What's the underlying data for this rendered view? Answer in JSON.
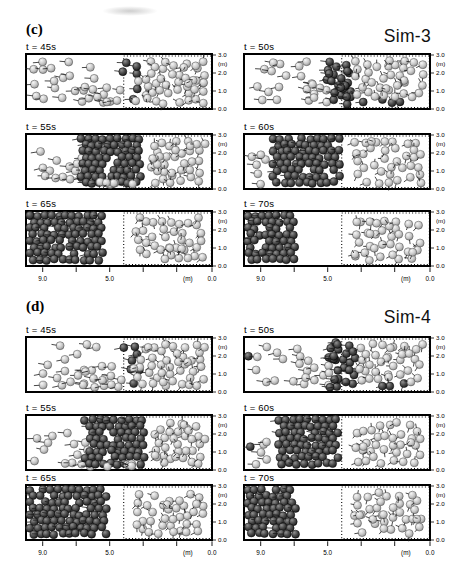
{
  "figure": {
    "background": "#ffffff",
    "colors": {
      "border": "#000000",
      "velocity_vector": "#1a1a1a",
      "dark_particle_highlight": "#909090",
      "dark_particle_core": "#4a4a4a",
      "dark_particle_edge": "#161616",
      "light_particle_highlight": "#f6f6f6",
      "light_particle_core": "#cccccc",
      "light_particle_edge": "#8c8c8c"
    },
    "y_axis": {
      "unit": "(m)",
      "tick_labels": [
        "3.0",
        "2.0",
        "1.0",
        "0.0"
      ]
    },
    "x_axis": {
      "unit": "(m)",
      "unit_frac": 0.87,
      "major": [
        {
          "label": "9.0",
          "frac": 0.09
        },
        {
          "label": "5.0",
          "frac": 0.45
        },
        {
          "label": "0.0",
          "frac": 1.0
        }
      ],
      "minor_fracs": [
        0.27,
        0.63,
        0.81
      ]
    },
    "dashed_sample_region": {
      "x_start_frac": 0.525,
      "style": "dotted"
    },
    "panels": [
      {
        "panel_label": "(c)",
        "sim_label": "Sim-3",
        "subplots": [
          {
            "time_label": "t = 45s",
            "groups": [
              {
                "kind": "scatter",
                "color": "light",
                "n": 20,
                "x0": 0.01,
                "x1": 0.52,
                "y0": 0.05,
                "y1": 0.95,
                "vec": "left"
              },
              {
                "kind": "scatter",
                "color": "light",
                "n": 9,
                "x0": 0.28,
                "x1": 0.54,
                "y0": 0.5,
                "y1": 0.98,
                "vec": "left"
              },
              {
                "kind": "scatter",
                "color": "dark",
                "n": 6,
                "x0": 0.49,
                "x1": 0.63,
                "y0": 0.08,
                "y1": 0.92,
                "vec": "left"
              },
              {
                "kind": "scatter",
                "color": "light",
                "n": 44,
                "x0": 0.55,
                "x1": 0.985,
                "y0": 0.03,
                "y1": 0.97,
                "vec": "rand"
              }
            ]
          },
          {
            "time_label": "t = 50s",
            "groups": [
              {
                "kind": "scatter",
                "color": "light",
                "n": 15,
                "x0": 0.01,
                "x1": 0.4,
                "y0": 0.05,
                "y1": 0.95,
                "vec": "left"
              },
              {
                "kind": "scatter",
                "color": "light",
                "n": 7,
                "x0": 0.3,
                "x1": 0.48,
                "y0": 0.4,
                "y1": 0.98,
                "vec": "left"
              },
              {
                "kind": "scatter",
                "color": "dark",
                "n": 24,
                "x0": 0.42,
                "x1": 0.6,
                "y0": 0.02,
                "y1": 0.98,
                "vec": "left"
              },
              {
                "kind": "scatter",
                "color": "dark",
                "n": 4,
                "x0": 0.6,
                "x1": 0.88,
                "y0": 0.74,
                "y1": 0.98,
                "vec": "rand"
              },
              {
                "kind": "scatter",
                "color": "light",
                "n": 36,
                "x0": 0.56,
                "x1": 0.985,
                "y0": 0.03,
                "y1": 0.88,
                "vec": "rand"
              }
            ]
          },
          {
            "time_label": "t = 55s",
            "groups": [
              {
                "kind": "scatter",
                "color": "light",
                "n": 8,
                "x0": 0.01,
                "x1": 0.26,
                "y0": 0.15,
                "y1": 0.95,
                "vec": "left"
              },
              {
                "kind": "scatter",
                "color": "light",
                "n": 8,
                "x0": 0.2,
                "x1": 0.36,
                "y0": 0.35,
                "y1": 0.98,
                "vec": "left"
              },
              {
                "kind": "packed",
                "color": "dark",
                "x0": 0.28,
                "x1": 0.63,
                "y0": 0.0,
                "y1": 1.0,
                "vec": "left-sparse"
              },
              {
                "kind": "scatter",
                "color": "light",
                "n": 6,
                "x0": 0.37,
                "x1": 0.6,
                "y0": 0.8,
                "y1": 1.0,
                "vec": "rand"
              },
              {
                "kind": "scatter",
                "color": "light",
                "n": 36,
                "x0": 0.64,
                "x1": 0.985,
                "y0": 0.04,
                "y1": 0.97,
                "vec": "rand"
              }
            ]
          },
          {
            "time_label": "t = 60s",
            "groups": [
              {
                "kind": "scatter",
                "color": "light",
                "n": 6,
                "x0": 0.02,
                "x1": 0.17,
                "y0": 0.3,
                "y1": 0.98,
                "vec": "left"
              },
              {
                "kind": "packed",
                "color": "dark",
                "x0": 0.14,
                "x1": 0.53,
                "y0": 0.0,
                "y1": 1.0,
                "vec": "left-sparse"
              },
              {
                "kind": "scatter",
                "color": "light",
                "n": 36,
                "x0": 0.57,
                "x1": 0.975,
                "y0": 0.05,
                "y1": 0.97,
                "vec": "rand"
              }
            ]
          },
          {
            "time_label": "t = 65s",
            "groups": [
              {
                "kind": "scatter",
                "color": "dark",
                "n": 1,
                "x0": 0.0,
                "x1": 0.025,
                "y0": 0.0,
                "y1": 0.06,
                "vec": null
              },
              {
                "kind": "packed",
                "color": "dark",
                "x0": 0.0,
                "x1": 0.44,
                "y0": 0.0,
                "y1": 1.0,
                "vec": "left-sparse"
              },
              {
                "kind": "scatter",
                "color": "light",
                "n": 38,
                "x0": 0.56,
                "x1": 0.975,
                "y0": 0.04,
                "y1": 0.96,
                "vec": "rand"
              }
            ]
          },
          {
            "time_label": "t = 70s",
            "groups": [
              {
                "kind": "packed",
                "color": "dark",
                "x0": 0.0,
                "x1": 0.29,
                "y0": 0.0,
                "y1": 1.0,
                "vec": "left-sparse"
              },
              {
                "kind": "scatter",
                "color": "light",
                "n": 36,
                "x0": 0.57,
                "x1": 0.975,
                "y0": 0.05,
                "y1": 0.96,
                "vec": "rand"
              }
            ]
          }
        ]
      },
      {
        "panel_label": "(d)",
        "sim_label": "Sim-4",
        "subplots": [
          {
            "time_label": "t = 45s",
            "groups": [
              {
                "kind": "scatter",
                "color": "light",
                "n": 20,
                "x0": 0.01,
                "x1": 0.52,
                "y0": 0.05,
                "y1": 0.95,
                "vec": "left"
              },
              {
                "kind": "scatter",
                "color": "light",
                "n": 9,
                "x0": 0.28,
                "x1": 0.54,
                "y0": 0.5,
                "y1": 0.98,
                "vec": "left"
              },
              {
                "kind": "scatter",
                "color": "dark",
                "n": 7,
                "x0": 0.5,
                "x1": 0.64,
                "y0": 0.05,
                "y1": 0.95,
                "vec": "left"
              },
              {
                "kind": "scatter",
                "color": "light",
                "n": 44,
                "x0": 0.55,
                "x1": 0.985,
                "y0": 0.03,
                "y1": 0.97,
                "vec": "rand"
              }
            ]
          },
          {
            "time_label": "t = 50s",
            "groups": [
              {
                "kind": "scatter",
                "color": "dark",
                "n": 1,
                "x0": 0.0,
                "x1": 0.03,
                "y0": 0.25,
                "y1": 0.4,
                "vec": "left"
              },
              {
                "kind": "scatter",
                "color": "light",
                "n": 14,
                "x0": 0.03,
                "x1": 0.4,
                "y0": 0.05,
                "y1": 0.95,
                "vec": "left"
              },
              {
                "kind": "scatter",
                "color": "light",
                "n": 7,
                "x0": 0.3,
                "x1": 0.48,
                "y0": 0.4,
                "y1": 0.98,
                "vec": "left"
              },
              {
                "kind": "scatter",
                "color": "dark",
                "n": 26,
                "x0": 0.43,
                "x1": 0.62,
                "y0": 0.02,
                "y1": 0.98,
                "vec": "left"
              },
              {
                "kind": "scatter",
                "color": "dark",
                "n": 3,
                "x0": 0.62,
                "x1": 0.9,
                "y0": 0.76,
                "y1": 0.98,
                "vec": "rand"
              },
              {
                "kind": "scatter",
                "color": "light",
                "n": 34,
                "x0": 0.58,
                "x1": 0.985,
                "y0": 0.03,
                "y1": 0.9,
                "vec": "rand"
              }
            ]
          },
          {
            "time_label": "t = 55s",
            "groups": [
              {
                "kind": "scatter",
                "color": "light",
                "n": 8,
                "x0": 0.01,
                "x1": 0.28,
                "y0": 0.2,
                "y1": 0.98,
                "vec": "left"
              },
              {
                "kind": "scatter",
                "color": "light",
                "n": 7,
                "x0": 0.22,
                "x1": 0.37,
                "y0": 0.4,
                "y1": 1.0,
                "vec": "left"
              },
              {
                "kind": "packed",
                "color": "dark",
                "x0": 0.3,
                "x1": 0.65,
                "y0": 0.0,
                "y1": 1.0,
                "vec": "left-sparse"
              },
              {
                "kind": "scatter",
                "color": "light",
                "n": 5,
                "x0": 0.4,
                "x1": 0.62,
                "y0": 0.82,
                "y1": 1.0,
                "vec": "rand"
              },
              {
                "kind": "scatter",
                "color": "light",
                "n": 34,
                "x0": 0.66,
                "x1": 0.985,
                "y0": 0.04,
                "y1": 0.97,
                "vec": "rand"
              }
            ]
          },
          {
            "time_label": "t = 60s",
            "groups": [
              {
                "kind": "scatter",
                "color": "dark",
                "n": 1,
                "x0": 0.01,
                "x1": 0.04,
                "y0": 0.5,
                "y1": 0.65,
                "vec": "left"
              },
              {
                "kind": "scatter",
                "color": "light",
                "n": 5,
                "x0": 0.03,
                "x1": 0.16,
                "y0": 0.35,
                "y1": 0.98,
                "vec": "left"
              },
              {
                "kind": "packed",
                "color": "dark",
                "x0": 0.17,
                "x1": 0.52,
                "y0": 0.0,
                "y1": 1.0,
                "vec": "left-sparse"
              },
              {
                "kind": "scatter",
                "color": "light",
                "n": 35,
                "x0": 0.57,
                "x1": 0.975,
                "y0": 0.05,
                "y1": 0.97,
                "vec": "rand"
              }
            ]
          },
          {
            "time_label": "t = 65s",
            "groups": [
              {
                "kind": "packed",
                "color": "dark",
                "x0": 0.0,
                "x1": 0.46,
                "y0": 0.0,
                "y1": 1.0,
                "vec": "left-sparse"
              },
              {
                "kind": "scatter",
                "color": "light",
                "n": 37,
                "x0": 0.56,
                "x1": 0.975,
                "y0": 0.05,
                "y1": 0.96,
                "vec": "rand"
              }
            ]
          },
          {
            "time_label": "t = 70s",
            "groups": [
              {
                "kind": "packed",
                "color": "dark",
                "x0": 0.0,
                "x1": 0.3,
                "y0": 0.0,
                "y1": 1.0,
                "vec": "left-sparse"
              },
              {
                "kind": "scatter",
                "color": "light",
                "n": 36,
                "x0": 0.57,
                "x1": 0.975,
                "y0": 0.04,
                "y1": 0.96,
                "vec": "rand"
              }
            ]
          }
        ]
      }
    ]
  }
}
